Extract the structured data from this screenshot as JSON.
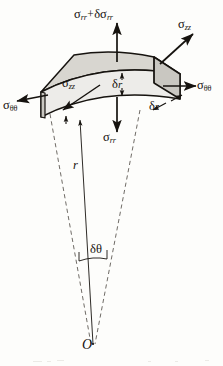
{
  "figure": {
    "background_color": "#fdfdfb",
    "ink_color": "#16130f",
    "block_top_fill": "#d8d6d0",
    "block_front_fill": "#e9e8e4",
    "block_side_fill": "#c9c7c1",
    "origin_marker": "O"
  },
  "labels": {
    "stress_radial_outer": {
      "symbol": "σ",
      "sub": "rr",
      "operator": "+",
      "symbol2": "δσ",
      "sub2": "rr",
      "full_text": "σrr + δσrr",
      "position": "top-center",
      "arrow": "up"
    },
    "stress_axial_top_right": {
      "symbol": "σ",
      "sub": "zz",
      "full_text": "σzz",
      "position": "top-right",
      "arrow": "up-right"
    },
    "stress_hoop_right": {
      "symbol": "σ",
      "sub": "θθ",
      "full_text": "σθθ",
      "position": "right",
      "arrow": "right"
    },
    "stress_hoop_left": {
      "symbol": "σ",
      "sub": "θθ",
      "full_text": "σθθ",
      "position": "left",
      "arrow": "left"
    },
    "stress_axial_inner": {
      "symbol": "σ",
      "sub": "zz",
      "full_text": "σzz",
      "position": "inside-front-face",
      "arrow": "down-left"
    },
    "stress_radial_inner": {
      "symbol": "σ",
      "sub": "rr",
      "full_text": "σrr",
      "position": "below-center",
      "arrow": "down"
    },
    "thickness_radial": {
      "symbol": "δ",
      "sub": "r",
      "full_text": "δr",
      "position": "front-face-center",
      "arrow": "double-vertical"
    },
    "thickness_axial": {
      "symbol": "δ",
      "sub": "z",
      "full_text": "δz",
      "position": "lower-right-edge",
      "arrow": "double-diagonal"
    },
    "radius": {
      "symbol": "r",
      "full_text": "r",
      "position": "mid-left-of-axis",
      "arrow": "up"
    },
    "angle_increment": {
      "symbol": "δ",
      "sub": "θ",
      "full_text": "δθ",
      "position": "near-apex",
      "arrow": "none"
    },
    "origin": {
      "symbol": "O",
      "full_text": "O",
      "position": "apex-bottom"
    }
  }
}
